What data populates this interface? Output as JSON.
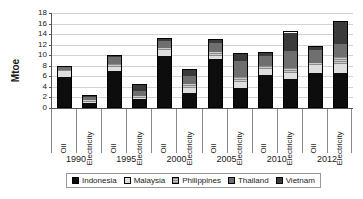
{
  "chart_data": {
    "type": "bar",
    "subtype": "stacked-bar-grouped",
    "title": "",
    "xlabel": "",
    "ylabel": "Mtoe",
    "ylim": [
      0,
      18
    ],
    "yticks": [
      0,
      2,
      4,
      6,
      8,
      10,
      12,
      14,
      16,
      18
    ],
    "grid": true,
    "legend_position": "bottom",
    "group_labels": [
      "1990",
      "1995",
      "2000",
      "2005",
      "2010",
      "2012"
    ],
    "subcategories": [
      "Oil",
      "Electricity"
    ],
    "categories": [
      "1990 Oil",
      "1990 Electricity",
      "1995 Oil",
      "1995 Electricity",
      "2000 Oil",
      "2000 Electricity",
      "2005 Oil",
      "2005 Electricity",
      "2010 Oil",
      "2010 Electricity",
      "2012 Oil",
      "2012 Electricity"
    ],
    "series": [
      {
        "name": "Indonesia",
        "color": "#0d0d0d",
        "values": [
          6.0,
          0.8,
          7.0,
          1.6,
          9.9,
          2.7,
          9.3,
          3.8,
          6.3,
          5.4,
          6.7,
          6.5
        ]
      },
      {
        "name": "Malaysia",
        "color": "#dedede",
        "values": [
          1.1,
          0.3,
          0.9,
          0.3,
          1.2,
          1.0,
          0.6,
          1.2,
          1.2,
          1.2,
          1.5,
          1.8
        ]
      },
      {
        "name": "Philippines",
        "color": "#b5b5b5",
        "values": [
          0.3,
          0.5,
          0.6,
          0.4,
          0.5,
          0.8,
          0.8,
          1.0,
          0.5,
          1.0,
          0.5,
          1.4
        ]
      },
      {
        "name": "Thailand",
        "color": "#6f6f6f",
        "values": [
          0.6,
          0.6,
          1.3,
          1.1,
          1.3,
          1.7,
          1.8,
          3.0,
          2.1,
          3.3,
          2.5,
          2.6
        ]
      },
      {
        "name": "Vietnam",
        "color": "#3b3b3b",
        "values": [
          0.0,
          0.2,
          0.2,
          1.2,
          0.4,
          1.2,
          0.5,
          1.4,
          0.5,
          3.6,
          0.6,
          4.2
        ]
      }
    ],
    "totals": [
      8.0,
      2.4,
      10.0,
      4.6,
      13.3,
      7.4,
      13.0,
      10.4,
      10.6,
      14.5,
      11.8,
      16.5
    ]
  },
  "legend": {
    "items": [
      {
        "label": "Indonesia"
      },
      {
        "label": "Malaysia"
      },
      {
        "label": "Philippines"
      },
      {
        "label": "Thailand"
      },
      {
        "label": "Vietnam"
      }
    ]
  }
}
